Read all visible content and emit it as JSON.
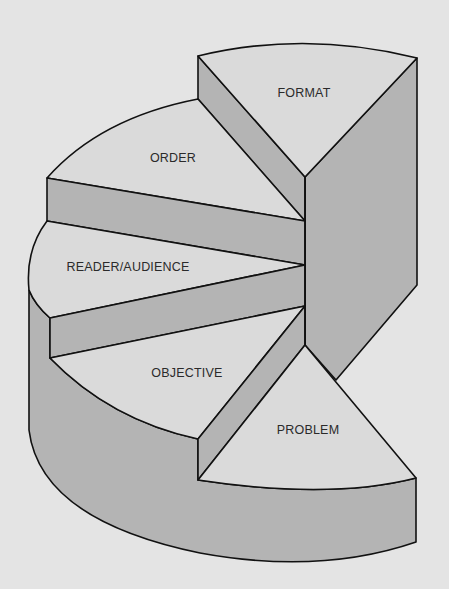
{
  "diagram": {
    "type": "exploded 3D pie / spiral staircase",
    "segments": [
      {
        "id": "format",
        "label": "FORMAT"
      },
      {
        "id": "order",
        "label": "ORDER"
      },
      {
        "id": "reader",
        "label": "READER/AUDIENCE"
      },
      {
        "id": "objective",
        "label": "OBJECTIVE"
      },
      {
        "id": "problem",
        "label": "PROBLEM"
      }
    ],
    "colors": {
      "background": "#e4e4e4",
      "top_face": "#dadada",
      "side_face": "#b4b4b4",
      "outline": "#111111",
      "text": "#2a2a2a"
    }
  }
}
